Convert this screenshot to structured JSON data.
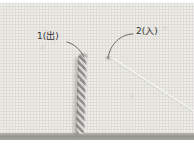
{
  "photo": {
    "labels": [
      {
        "text": "1(出)"
      },
      {
        "text": "2(入)"
      }
    ],
    "colors": {
      "page_bg": "#ffffff",
      "fabric_base": "#eeede9",
      "fabric_weave": "#dedcd6",
      "fabric_edge_shadow": "#96948f",
      "thread_dark": "#8f8e8a",
      "thread_light": "#d6d5d1",
      "needle_light": "#f2f2ef",
      "needle_dark": "#bdbcb8",
      "label_text": "#333333",
      "leader_line": "#4a4a4a"
    }
  }
}
